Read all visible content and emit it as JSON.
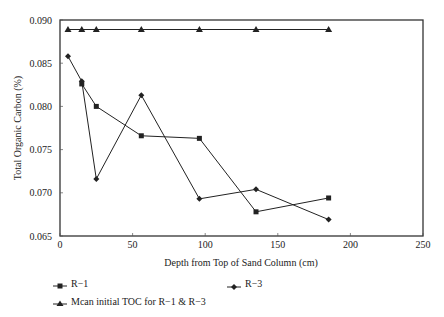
{
  "chart_data": {
    "type": "line",
    "title": "",
    "xlabel": "Depth from Top of Sand Column (cm)",
    "ylabel": "Total Organic Carbon (%)",
    "xlim": [
      0,
      250
    ],
    "ylim": [
      0.065,
      0.09
    ],
    "x_ticks": [
      0,
      50,
      100,
      150,
      200,
      250
    ],
    "y_ticks": [
      0.065,
      0.07,
      0.075,
      0.08,
      0.085,
      0.09
    ],
    "x_tick_labels": [
      "0",
      "50",
      "100",
      "150",
      "200",
      "250"
    ],
    "y_tick_labels": [
      "0.065",
      "0.070",
      "0.075",
      "0.080",
      "0.085",
      "0.090"
    ],
    "grid": false,
    "legend_position": "below",
    "series": [
      {
        "name": "R-1",
        "marker": "square",
        "x": [
          15,
          25,
          56,
          96,
          135,
          185
        ],
        "values": [
          0.0826,
          0.08,
          0.0766,
          0.0763,
          0.0678,
          0.0694
        ]
      },
      {
        "name": "R-3",
        "marker": "diamond",
        "x": [
          5.5,
          15,
          25,
          56,
          96,
          135,
          185
        ],
        "values": [
          0.0858,
          0.0829,
          0.0716,
          0.0813,
          0.0693,
          0.0704,
          0.0669
        ]
      },
      {
        "name": "Mean initial TOC for R-1 & R-3",
        "marker": "triangle",
        "x": [
          5.5,
          15,
          25,
          56,
          96,
          135,
          185
        ],
        "values": [
          0.0889,
          0.0889,
          0.0889,
          0.0889,
          0.0889,
          0.0889,
          0.0889
        ]
      }
    ]
  },
  "legend": {
    "items": [
      {
        "label": "R−1",
        "marker": "square"
      },
      {
        "label": "R−3",
        "marker": "diamond"
      },
      {
        "label": "Mcan initial TOC for R−1 & R−3",
        "marker": "triangle"
      }
    ]
  },
  "colors": {
    "line": "#222222",
    "frame": "#333333",
    "background": "#ffffff"
  }
}
